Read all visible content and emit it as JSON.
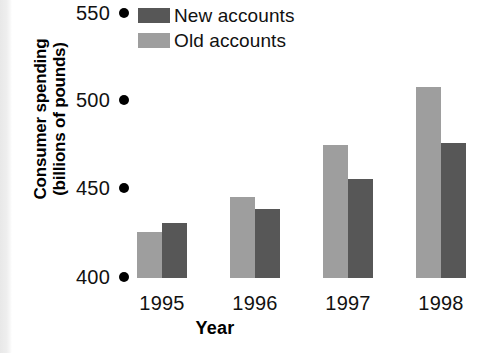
{
  "chart_data": {
    "type": "bar",
    "title": "",
    "subtitle": "",
    "xlabel": "Year",
    "ylabel": "Consumer spending (billions of pounds)",
    "ylabel_line1": "Consumer spending",
    "ylabel_line2": "(billions of pounds)",
    "categories": [
      "1995",
      "1996",
      "1997",
      "1998"
    ],
    "series": [
      {
        "name": "Old accounts",
        "color": "#9e9e9e",
        "values": [
          426,
          446,
          475,
          508
        ]
      },
      {
        "name": "New accounts",
        "color": "#575757",
        "values": [
          431,
          439,
          456,
          476
        ]
      }
    ],
    "yticks": [
      400,
      450,
      500,
      550
    ],
    "ytick_labels": [
      "400",
      "450",
      "500",
      "550"
    ],
    "ylim": [
      400,
      550
    ],
    "grid": false,
    "legend_position": "top",
    "bar_order": [
      "Old accounts",
      "New accounts"
    ],
    "axis_tick_marker": "filled-circle"
  },
  "legend": {
    "entries": [
      {
        "label": "New accounts",
        "color": "#575757"
      },
      {
        "label": "Old accounts",
        "color": "#9e9e9e"
      }
    ]
  },
  "axes": {
    "y_title_line1": "Consumer spending",
    "y_title_line2": "(billions of pounds)",
    "x_title": "Year",
    "y_tick_550": "550",
    "y_tick_500": "500",
    "y_tick_450": "450",
    "y_tick_400": "400",
    "x_tick_0": "1995",
    "x_tick_1": "1996",
    "x_tick_2": "1997",
    "x_tick_3": "1998"
  }
}
